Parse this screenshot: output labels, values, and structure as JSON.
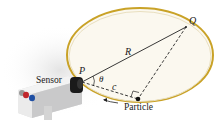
{
  "labels": {
    "sensor": "Sensor",
    "particle": "Particle",
    "P": "P",
    "Q": "Q",
    "R": "R",
    "c": "c",
    "theta": "θ"
  },
  "colors": {
    "rim": "#c9a227",
    "disk_fill": "#fbf8ef",
    "line": "#222222",
    "sensor_body": "#e9e9ea",
    "sensor_red": "#c0272d",
    "sensor_blue": "#1f4fa3"
  }
}
